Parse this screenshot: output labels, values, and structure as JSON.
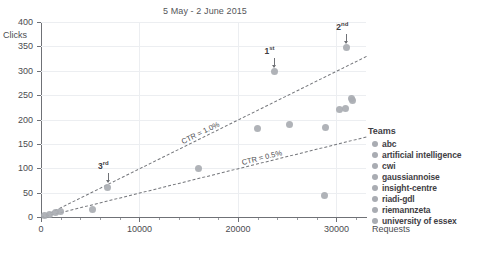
{
  "chart_data": {
    "type": "scatter",
    "title": "5 May - 2 June 2015",
    "xlabel": "Requests",
    "ylabel": "Clicks",
    "xlim": [
      0,
      33000
    ],
    "ylim": [
      0,
      400
    ],
    "xticks": [
      0,
      10000,
      20000,
      30000
    ],
    "xtick_labels": [
      "0",
      "10000",
      "20000",
      "30000"
    ],
    "yticks": [
      0,
      50,
      100,
      150,
      200,
      250,
      300,
      350,
      400
    ],
    "ytick_labels": [
      "0",
      "50",
      "100",
      "150",
      "200",
      "250",
      "300",
      "350",
      "400"
    ],
    "grid": true,
    "legend_position": "right",
    "points": [
      {
        "x": 400,
        "y": 3
      },
      {
        "x": 900,
        "y": 6
      },
      {
        "x": 1500,
        "y": 9
      },
      {
        "x": 2000,
        "y": 11
      },
      {
        "x": 5200,
        "y": 16
      },
      {
        "x": 6800,
        "y": 61,
        "rank": "3rd"
      },
      {
        "x": 16000,
        "y": 100
      },
      {
        "x": 22000,
        "y": 181
      },
      {
        "x": 23700,
        "y": 298,
        "rank": "1st"
      },
      {
        "x": 25200,
        "y": 190
      },
      {
        "x": 28800,
        "y": 44
      },
      {
        "x": 28900,
        "y": 183
      },
      {
        "x": 30300,
        "y": 221
      },
      {
        "x": 30900,
        "y": 223
      },
      {
        "x": 31000,
        "y": 347,
        "rank": "2nd"
      },
      {
        "x": 31500,
        "y": 244
      },
      {
        "x": 31650,
        "y": 240
      }
    ],
    "reference_lines": [
      {
        "label": "CTR = 1.0%",
        "slope": 0.01,
        "intercept": 0
      },
      {
        "label": "CTR = 0.5%",
        "slope": 0.005,
        "intercept": 0
      }
    ],
    "annotations": [
      {
        "text": "1st",
        "base": "1",
        "sup": "st",
        "x": 23700,
        "y": 298
      },
      {
        "text": "2nd",
        "base": "2",
        "sup": "nd",
        "x": 31000,
        "y": 347
      },
      {
        "text": "3rd",
        "base": "3",
        "sup": "rd",
        "x": 6800,
        "y": 61
      }
    ],
    "marker_color": "#a9acb2"
  },
  "legend": {
    "title": "Teams",
    "items": [
      {
        "label": "abc"
      },
      {
        "label": "artificial intelligence"
      },
      {
        "label": "cwi"
      },
      {
        "label": "gaussiannoise"
      },
      {
        "label": "insight-centre"
      },
      {
        "label": "riadi-gdl"
      },
      {
        "label": "riemannzeta"
      },
      {
        "label": "university of essex"
      }
    ]
  }
}
